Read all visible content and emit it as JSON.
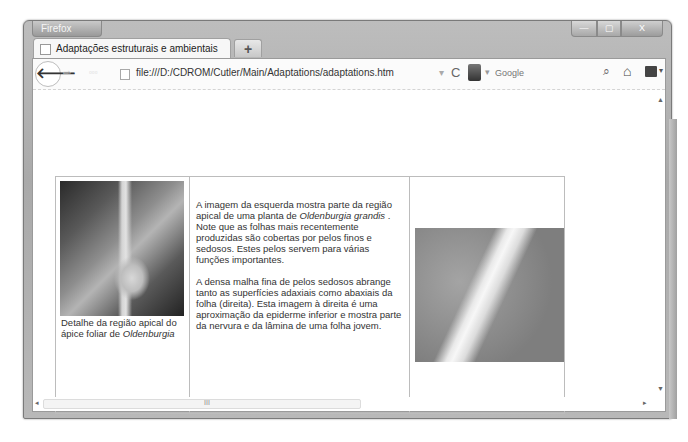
{
  "browser": {
    "app_button": "Firefox",
    "window_controls": {
      "minimize": "—",
      "maximize": "▢",
      "close": "X"
    },
    "tab": {
      "title": "Adaptações estruturais e ambientais"
    },
    "new_tab_label": "+",
    "navbar": {
      "back_glyph": "🡐",
      "forward_glyph": "⇨",
      "url": "file:///D:/CDROM/Cutler/Main/Adaptations/adaptations.htm",
      "url_dropdown": "▾",
      "reload_glyph": "C",
      "search_placeholder": "Google",
      "search_engine_dropdown": "▾",
      "search_glyph": "⌕",
      "home_glyph": "⌂",
      "bookmarks_dropdown": "▾"
    },
    "scrollbars": {
      "up": "▲",
      "down": "▼",
      "left": "◂",
      "right": "▸",
      "grip": "III"
    }
  },
  "page": {
    "left_caption": {
      "text": "Detalhe da região apical do ápice foliar de",
      "italic": "Oldenburgia"
    },
    "paragraph1": {
      "before": "A imagem da esquerda mostra parte da região apical de uma planta de ",
      "species": "Oldenburgia grandis",
      "after": " . Note que as folhas mais recentemente produzidas são cobertas por pelos finos e sedosos. Estes pelos servem para várias funções importantes."
    },
    "paragraph2": "A densa malha fina de pelos sedosos abrange tanto as superfícies adaxiais como abaxiais da folha (direita). Esta imagem à direita é uma aproximação da epiderme inferior e mostra parte da nervura e da lâmina de uma folha jovem.",
    "left_image_alt": "Oldenburgia apical region photo",
    "right_image_alt": "Leaf epidermis close-up photo"
  }
}
